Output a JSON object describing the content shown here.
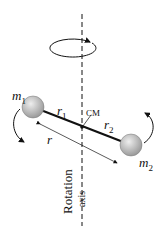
{
  "diagram": {
    "labels": {
      "m1": "m",
      "m1_sub": "1",
      "m2": "m",
      "m2_sub": "2",
      "r1": "r",
      "r1_sub": "1",
      "r2": "r",
      "r2_sub": "2",
      "r": "r",
      "cm": "CM",
      "axis_line1": "Rotation",
      "axis_line2": "axis"
    },
    "colors": {
      "line": "#111111",
      "mass_fill": "#b8b8b8"
    }
  }
}
